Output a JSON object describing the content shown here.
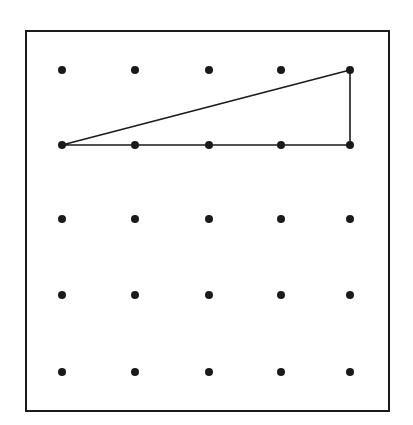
{
  "diagram": {
    "type": "geoboard-dot-grid",
    "colors": {
      "background": "#ffffff",
      "ink": "#1a1a1a"
    },
    "frame": {
      "x": 26,
      "y": 31,
      "width": 363,
      "height": 380
    },
    "grid": {
      "rows": 5,
      "cols": 5,
      "x_positions": [
        62,
        135,
        209,
        281,
        350
      ],
      "y_positions": [
        70,
        145,
        219,
        295,
        372
      ],
      "dot_radius": 4
    },
    "shapes": [
      {
        "name": "right-triangle",
        "vertices_grid": [
          [
            0,
            1
          ],
          [
            4,
            1
          ],
          [
            4,
            0
          ]
        ],
        "note": "vertices given as [col,row]; right angle at [4,1]"
      }
    ]
  }
}
